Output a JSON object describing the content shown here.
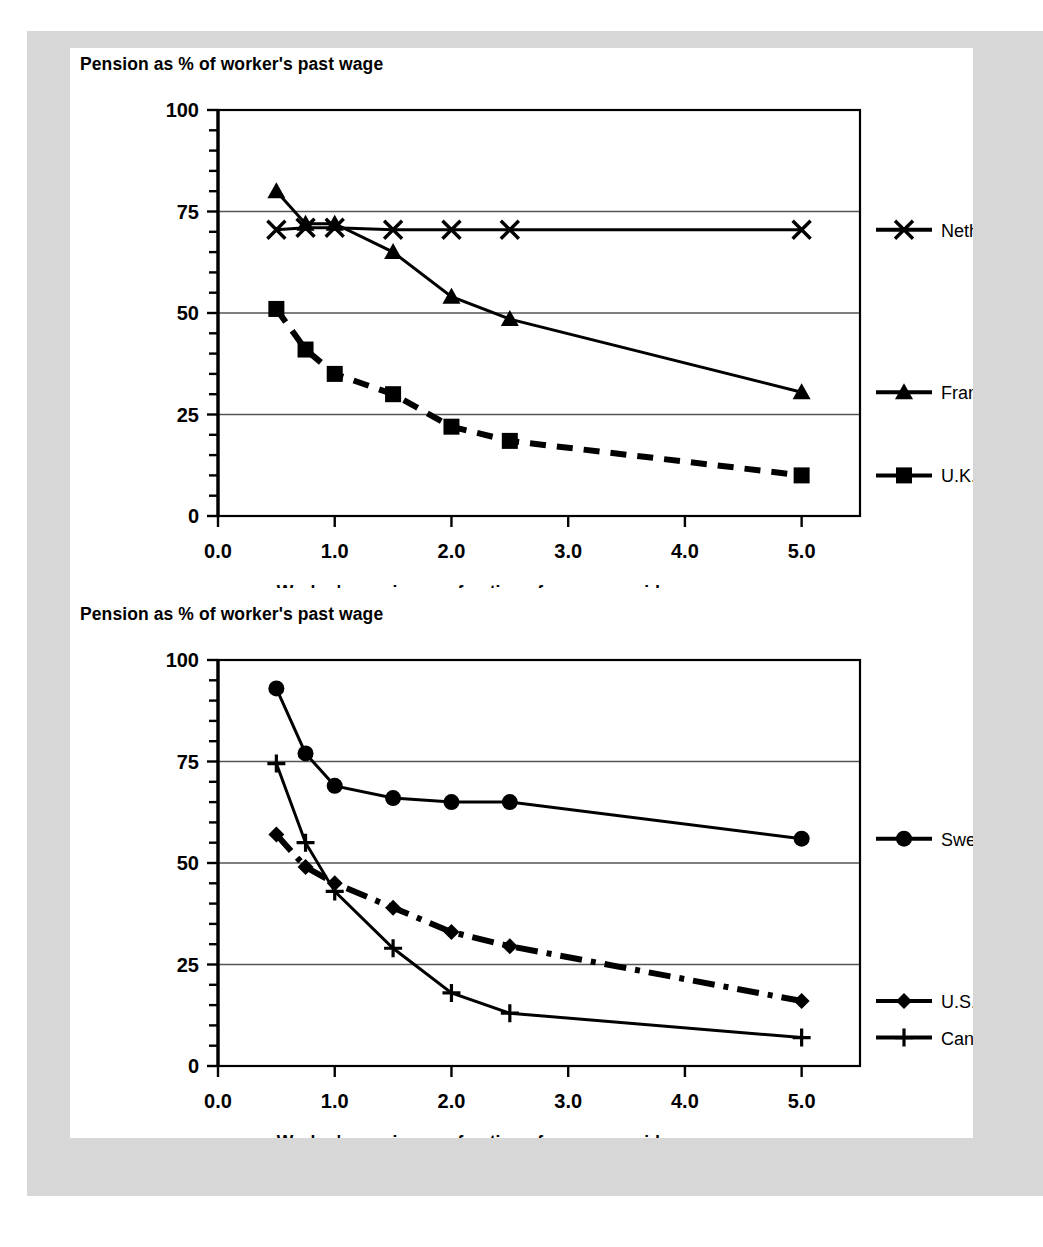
{
  "page": {
    "background_color": "#ffffff",
    "mat_color": "#d7d7d7",
    "ink_color": "#000000",
    "gridline_color": "#555555"
  },
  "charts": [
    {
      "id": "top",
      "title": "Pension as % of worker's past wage",
      "xlabel": "Worker's earnings as fraction of economy-wide average wage",
      "ylabel": "",
      "ytick_labels": [
        "0",
        "25",
        "50",
        "75",
        "100"
      ],
      "xtick_labels": [
        "0.0",
        "1.0",
        "2.0",
        "3.0",
        "4.0",
        "5.0"
      ],
      "legend": [
        {
          "label": "Netherlands",
          "marker": "x-marker",
          "dash": "none"
        },
        {
          "label": "France",
          "marker": "triangle-marker",
          "dash": "none"
        },
        {
          "label": "U.K.",
          "marker": "square-marker",
          "dash": "dashed"
        }
      ]
    },
    {
      "id": "bottom",
      "title": "Pension as % of worker's past wage",
      "xlabel": "Worker's earnings as fraction of economy-wide average wage",
      "ylabel": "",
      "ytick_labels": [
        "0",
        "25",
        "50",
        "75",
        "100"
      ],
      "xtick_labels": [
        "0.0",
        "1.0",
        "2.0",
        "3.0",
        "4.0",
        "5.0"
      ],
      "legend": [
        {
          "label": "Sweden",
          "marker": "circle-marker",
          "dash": "none"
        },
        {
          "label": "U.S.A.",
          "marker": "diamond-marker",
          "dash": "dashdot"
        },
        {
          "label": "Canada",
          "marker": "plus-marker",
          "dash": "none"
        }
      ]
    }
  ],
  "chart_data": [
    {
      "type": "line",
      "id": "top",
      "title": "Pension as % of worker's past wage",
      "xlabel": "Worker's earnings as fraction of economy-wide average wage",
      "ylabel": "Pension as % of worker's past wage",
      "xlim": [
        0.0,
        5.5
      ],
      "ylim": [
        0,
        100
      ],
      "xticks": [
        0.0,
        1.0,
        2.0,
        3.0,
        4.0,
        5.0
      ],
      "yticks": [
        0,
        25,
        50,
        75,
        100
      ],
      "yminor_step": 5,
      "grid": "horizontal",
      "legend_position": "right",
      "x": [
        0.5,
        0.75,
        1.0,
        1.5,
        2.0,
        2.5,
        5.0
      ],
      "series": [
        {
          "name": "Netherlands",
          "marker": "x",
          "dash": "solid",
          "values": [
            70.5,
            71.0,
            71.0,
            70.5,
            70.5,
            70.5,
            70.5
          ]
        },
        {
          "name": "France",
          "marker": "triangle",
          "dash": "solid",
          "values": [
            80.0,
            72.0,
            72.0,
            65.0,
            54.0,
            48.5,
            30.5
          ]
        },
        {
          "name": "U.K.",
          "marker": "square",
          "dash": "dashed",
          "values": [
            51.0,
            41.0,
            35.0,
            30.0,
            22.0,
            18.5,
            10.0
          ]
        }
      ]
    },
    {
      "type": "line",
      "id": "bottom",
      "title": "Pension as % of worker's past wage",
      "xlabel": "Worker's earnings as fraction of economy-wide average wage",
      "ylabel": "Pension as % of worker's past wage",
      "xlim": [
        0.0,
        5.5
      ],
      "ylim": [
        0,
        100
      ],
      "xticks": [
        0.0,
        1.0,
        2.0,
        3.0,
        4.0,
        5.0
      ],
      "yticks": [
        0,
        25,
        50,
        75,
        100
      ],
      "yminor_step": 5,
      "grid": "horizontal",
      "legend_position": "right",
      "x": [
        0.5,
        0.75,
        1.0,
        1.5,
        2.0,
        2.5,
        5.0
      ],
      "series": [
        {
          "name": "Sweden",
          "marker": "circle",
          "dash": "solid",
          "values": [
            93.0,
            77.0,
            69.0,
            66.0,
            65.0,
            65.0,
            56.0
          ]
        },
        {
          "name": "U.S.A.",
          "marker": "diamond",
          "dash": "dashdot",
          "values": [
            57.0,
            49.0,
            45.0,
            39.0,
            33.0,
            29.5,
            16.0
          ]
        },
        {
          "name": "Canada",
          "marker": "plus",
          "dash": "solid",
          "values": [
            74.5,
            55.0,
            43.0,
            29.0,
            18.0,
            13.0,
            7.0
          ]
        }
      ]
    }
  ]
}
